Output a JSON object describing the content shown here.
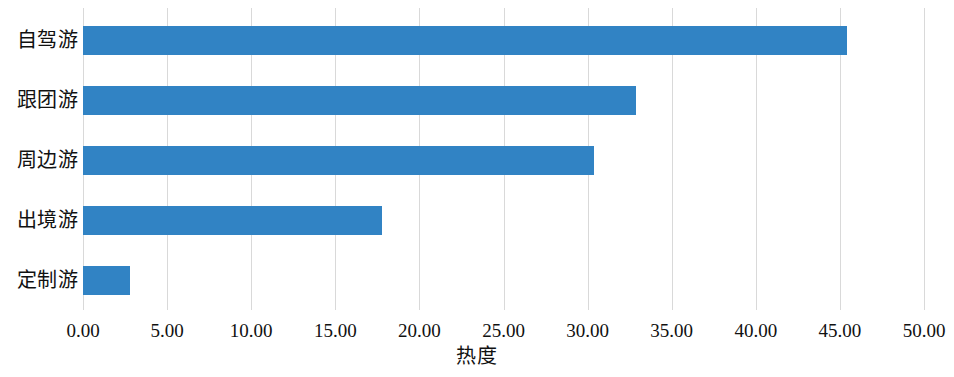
{
  "chart_data": {
    "type": "bar",
    "orientation": "horizontal",
    "title": "",
    "subtitle": "",
    "xlabel": "热度",
    "ylabel": "",
    "categories": [
      "自驾游",
      "跟团游",
      "周边游",
      "出境游",
      "定制游"
    ],
    "values": [
      45.4,
      32.9,
      30.4,
      17.8,
      2.8
    ],
    "series": [
      {
        "name": "热度",
        "values": [
          45.4,
          32.9,
          30.4,
          17.8,
          2.8
        ],
        "color": "#3183c4"
      }
    ],
    "xlim": [
      0,
      50
    ],
    "xticks": [
      0,
      5,
      10,
      15,
      20,
      25,
      30,
      35,
      40,
      45,
      50
    ],
    "xtick_labels": [
      "0.00",
      "5.00",
      "10.00",
      "15.00",
      "20.00",
      "25.00",
      "30.00",
      "35.00",
      "40.00",
      "45.00",
      "50.00"
    ],
    "grid": "vertical",
    "legend": "none",
    "background": "#ffffff",
    "gridline_color": "#d9d9d9",
    "bar_color": "#3183c4",
    "annotations": []
  }
}
